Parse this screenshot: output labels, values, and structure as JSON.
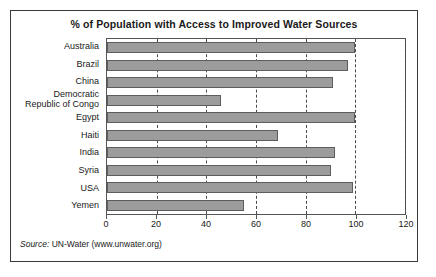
{
  "chart_data": {
    "type": "bar",
    "orientation": "horizontal",
    "title": "% of Population with Access to Improved Water Sources",
    "xlabel": "",
    "ylabel": "",
    "xlim": [
      0,
      120
    ],
    "xticks": [
      0,
      20,
      40,
      60,
      80,
      100,
      120
    ],
    "xticklabels": [
      "0",
      "20",
      "40",
      "60",
      "80",
      "100",
      "120"
    ],
    "grid": "vertical-dashed",
    "legend": null,
    "bar_color": "#9c9c9c",
    "bar_edge_color": "#5d5d5d",
    "categories": [
      "Australia",
      "Brazil",
      "China",
      "Democratic Republic of Congo",
      "Egypt",
      "Haiti",
      "India",
      "Syria",
      "USA",
      "Yemen"
    ],
    "category_lines": [
      [
        "Australia"
      ],
      [
        "Brazil"
      ],
      [
        "China"
      ],
      [
        "Democratic",
        "Republic of Congo"
      ],
      [
        "Egypt"
      ],
      [
        "Haiti"
      ],
      [
        "India"
      ],
      [
        "Syria"
      ],
      [
        "USA"
      ],
      [
        "Yemen"
      ]
    ],
    "values": [
      100,
      97,
      91,
      46,
      100,
      69,
      92,
      90,
      99,
      55
    ]
  },
  "source": {
    "label": "Source:",
    "text": " UN-Water (www.unwater.org)"
  }
}
